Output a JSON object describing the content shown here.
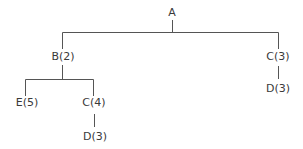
{
  "tree": {
    "nodes": [
      {
        "id": "A",
        "label": "A",
        "x": 172,
        "y": 13
      },
      {
        "id": "B",
        "label": "B(2)",
        "x": 63,
        "y": 57
      },
      {
        "id": "C1",
        "label": "C(3)",
        "x": 278,
        "y": 57
      },
      {
        "id": "E",
        "label": "E(5)",
        "x": 27,
        "y": 103
      },
      {
        "id": "C2",
        "label": "C(4)",
        "x": 94,
        "y": 103
      },
      {
        "id": "D1",
        "label": "D(3)",
        "x": 95,
        "y": 137
      },
      {
        "id": "D2",
        "label": "D(3)",
        "x": 278,
        "y": 89
      }
    ],
    "edges": [
      [
        "A",
        "B"
      ],
      [
        "A",
        "C1"
      ],
      [
        "B",
        "E"
      ],
      [
        "B",
        "C2"
      ],
      [
        "C2",
        "D1"
      ],
      [
        "C1",
        "D2"
      ]
    ],
    "line_color": "#555555"
  }
}
